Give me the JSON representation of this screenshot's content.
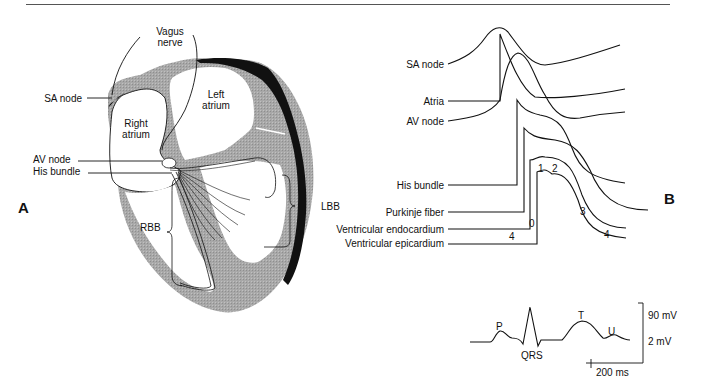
{
  "figure": {
    "panel_a": {
      "letter": "A",
      "labels": {
        "vagus_nerve_line1": "Vagus",
        "vagus_nerve_line2": "nerve",
        "sa_node": "SA node",
        "left_atrium_line1": "Left",
        "left_atrium_line2": "atrium",
        "right_atrium_line1": "Right",
        "right_atrium_line2": "atrium",
        "av_node": "AV node",
        "his_bundle": "His bundle",
        "rbb": "RBB",
        "lbb": "LBB"
      }
    },
    "panel_b": {
      "letter": "B",
      "trace_labels": {
        "sa_node": "SA node",
        "atria": "Atria",
        "av_node": "AV node",
        "his_bundle": "His bundle",
        "purkinje_fiber": "Purkinje fiber",
        "ventricular_endocardium": "Ventricular endocardium",
        "ventricular_epicardium": "Ventricular epicardium"
      },
      "phase_labels": {
        "phase0": "0",
        "phase1": "1",
        "phase2": "2",
        "phase3": "3",
        "phase4_left": "4",
        "phase4_right": "4"
      }
    },
    "ecg": {
      "waves": {
        "p": "P",
        "qrs": "QRS",
        "t": "T",
        "u": "U"
      },
      "scale": {
        "vertical_top": "90 mV",
        "vertical_bottom": "2 mV",
        "horizontal": "200 ms"
      }
    }
  }
}
